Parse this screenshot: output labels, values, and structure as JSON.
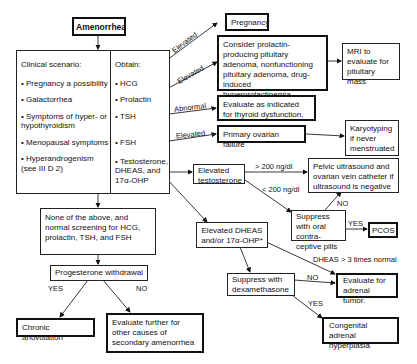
{
  "diagram": {
    "root": "Amenorrhea",
    "clinical_scenario": {
      "heading": "Clinical scenario:",
      "items": [
        "• Pregnancy a possibility",
        "• Galactorrhea",
        "• Symptoms of hyper- or hypothyroidism",
        "• Menopausal symptoms",
        "• Hyperandrogenism (see III D 2)"
      ]
    },
    "obtain": {
      "heading": "Obtain:",
      "items": [
        "• HCG",
        "• Prolactin",
        "• TSH",
        "• FSH",
        "• Testosterone, DHEAS, and 17α-OHP"
      ]
    },
    "edge_labels": {
      "hcg": "Elevated",
      "prolactin": "Elevated",
      "tsh": "Abnormal",
      "fsh": "Elevated",
      "testo_high": "> 200 ng/dl",
      "testo_low": "< 200 ng/dl",
      "ocp_no": "NO",
      "ocp_yes": "YES",
      "dheas_high": "DHEAS > 3 times normal",
      "dexa_no": "NO",
      "dexa_yes": "YES",
      "prog_yes": "YES",
      "prog_no": "NO"
    },
    "nodes": {
      "pregnancy": "Pregnancy",
      "prolactin_result": "Consider prolactin-producing pituitary adenoma, nonfunctioning pituitary adenoma, drug-induced hyperprolactinemia.",
      "mri": "MRI to evaluate for pituitary mass",
      "thyroid": "Evaluate as indicated for thyroid dysfunction.",
      "ovarian_failure": "Primary ovarian failure",
      "karyotyping": "Karyotyping if never menstruated",
      "elevated_testosterone": "Elevated testosterone",
      "pelvic_ultrasound": "Pelvic ultrasound and ovarian vein catheter if ultrasound is negative",
      "suppress_ocp": "Suppress with oral contra-ceptive pills",
      "pcos": "PCOS",
      "elevated_dheas": "Elevated DHEAS and/or 17α-OHP*",
      "suppress_dexa": "Suppress with dexamethasone",
      "adrenal_tumor": "Evaluate for adrenal tumor.",
      "cah": "Congenital adrenal hyperplasia",
      "none_above": "None of the above, and normal screening for HCG, prolactin, TSH, and FSH",
      "progesterone": "Progesterone withdrawal",
      "chronic_anovulation": "Chronic anovulation",
      "evaluate_further": "Evaluate further for other causes of secondary amenorrhea"
    }
  }
}
